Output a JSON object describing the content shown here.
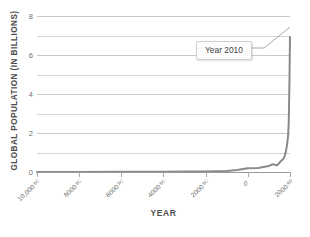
{
  "chart_data": {
    "type": "line",
    "title": "",
    "xlabel": "YEAR",
    "ylabel": "GLOBAL POPULATION (IN BILLIONS)",
    "xlim": [
      -10000,
      2010
    ],
    "ylim": [
      0,
      8
    ],
    "grid": true,
    "legend": false,
    "x_tick_labels": [
      {
        "value": -10000,
        "number": "10,000",
        "era": "BC"
      },
      {
        "value": -8000,
        "number": "8000",
        "era": "BC"
      },
      {
        "value": -6000,
        "number": "6000",
        "era": "BC"
      },
      {
        "value": -4000,
        "number": "4000",
        "era": "BC"
      },
      {
        "value": -2000,
        "number": "2000",
        "era": "BC"
      },
      {
        "value": 0,
        "number": "0",
        "era": ""
      },
      {
        "value": 2000,
        "number": "2000",
        "era": "AD"
      }
    ],
    "y_tick_labels": [
      {
        "value": 8,
        "label": "8"
      },
      {
        "value": 7,
        "label": ""
      },
      {
        "value": 6,
        "label": "6"
      },
      {
        "value": 5,
        "label": ""
      },
      {
        "value": 4,
        "label": "4"
      },
      {
        "value": 3,
        "label": ""
      },
      {
        "value": 2,
        "label": "2"
      },
      {
        "value": 1,
        "label": ""
      },
      {
        "value": 0,
        "label": "0"
      }
    ],
    "series": [
      {
        "name": "Global population",
        "color": "#8a8a8a",
        "x": [
          -10000,
          -8000,
          -6000,
          -5000,
          -4000,
          -3000,
          -2000,
          -1000,
          -500,
          0,
          500,
          1000,
          1200,
          1400,
          1500,
          1600,
          1700,
          1750,
          1800,
          1850,
          1900,
          1927,
          1950,
          1960,
          1974,
          1987,
          1999,
          2010
        ],
        "values": [
          0.004,
          0.005,
          0.007,
          0.01,
          0.014,
          0.02,
          0.03,
          0.05,
          0.1,
          0.19,
          0.21,
          0.31,
          0.4,
          0.35,
          0.46,
          0.58,
          0.68,
          0.79,
          0.98,
          1.26,
          1.65,
          2.0,
          2.52,
          3.02,
          4.0,
          5.0,
          6.0,
          6.92
        ]
      }
    ],
    "annotations": [
      {
        "label": "Year 2010",
        "points_to_x": 2010,
        "points_to_y": 6.92
      }
    ]
  },
  "axes": {
    "y_title": "GLOBAL POPULATION (IN BILLIONS)",
    "x_title": "YEAR"
  },
  "annotation": {
    "callout_label": "Year 2010"
  },
  "colors": {
    "series_line": "#8a8a8a",
    "gridline": "#d6d6d6",
    "axis_line": "#9a9a9a",
    "text": "#5a5a5a",
    "callout_bg": "#fdfdfd",
    "callout_border": "#cfcfcf"
  }
}
